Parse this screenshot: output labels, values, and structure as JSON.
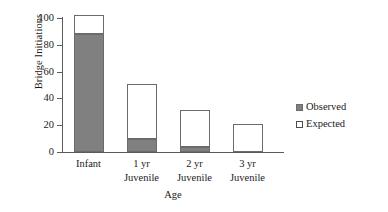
{
  "chart_data": {
    "type": "bar",
    "title": "",
    "subtitle": "",
    "xlabel": "Age",
    "ylabel": "Bridge Initiations",
    "categories": [
      "Infant",
      "1 yr\nJuvenile",
      "2 yr\nJuvenile",
      "3 yr\nJuvenile"
    ],
    "category_labels_flat": [
      "Infant",
      "1 yr Juvenile",
      "2 yr Juvenile",
      "3 yr Juvenile"
    ],
    "series": [
      {
        "name": "Observed",
        "values": [
          88,
          10,
          4,
          0
        ],
        "color": "#808080"
      },
      {
        "name": "Expected",
        "values": [
          14,
          41,
          27,
          21
        ],
        "color": "#ffffff"
      }
    ],
    "stacked": true,
    "ylim": [
      0,
      100
    ],
    "yticks": [
      0,
      20,
      40,
      60,
      80,
      100
    ],
    "ytick_labels": [
      "0",
      "20",
      "40",
      "60",
      "80",
      "100"
    ],
    "grid": false,
    "legend_position": "right",
    "legend_entries": [
      "Observed",
      "Expected"
    ],
    "axis_color": "#5b5b5b",
    "bar_outline_color": "#6b6b6b"
  }
}
